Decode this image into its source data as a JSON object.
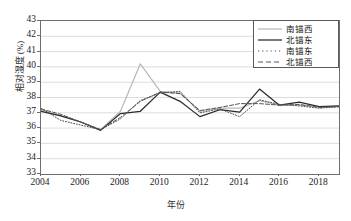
{
  "chart_data": {
    "type": "line",
    "title": "",
    "xlabel": "年份",
    "ylabel": "相对湿度 (%)",
    "xlim": [
      2004,
      2019
    ],
    "ylim": [
      33,
      43
    ],
    "grid": "horizontal",
    "legend_position": "top-right",
    "x": [
      2004,
      2005,
      2006,
      2007,
      2008,
      2009,
      2010,
      2011,
      2012,
      2013,
      2014,
      2015,
      2016,
      2017,
      2018,
      2019
    ],
    "y_ticks": [
      33,
      34,
      35,
      36,
      37,
      38,
      39,
      40,
      41,
      42,
      43
    ],
    "x_ticks": [
      2004,
      2006,
      2008,
      2010,
      2012,
      2014,
      2016,
      2018
    ],
    "series": [
      {
        "name": "南锚西",
        "style": "solid",
        "color": "#b9b9b9",
        "values": [
          37.2,
          36.8,
          36.4,
          35.9,
          37.1,
          40.2,
          38.4,
          38.3,
          37.1,
          37.3,
          37.3,
          37.8,
          37.5,
          37.5,
          37.4,
          37.4
        ]
      },
      {
        "name": "北锚东",
        "style": "solid",
        "color": "#2b2b2b",
        "values": [
          37.1,
          36.8,
          36.4,
          35.85,
          36.95,
          37.1,
          38.35,
          37.75,
          36.75,
          37.2,
          37.05,
          38.55,
          37.5,
          37.7,
          37.4,
          37.45
        ]
      },
      {
        "name": "南锚东",
        "style": "dotted",
        "color": "#4a4a4a",
        "values": [
          37.3,
          36.5,
          36.2,
          35.9,
          36.6,
          37.8,
          38.3,
          38.4,
          37.0,
          37.25,
          36.75,
          37.85,
          37.55,
          37.45,
          37.3,
          37.4
        ]
      },
      {
        "name": "北锚西",
        "style": "dashed",
        "color": "#555555",
        "values": [
          37.25,
          36.9,
          36.4,
          35.9,
          36.7,
          37.75,
          38.35,
          38.25,
          37.15,
          37.35,
          37.6,
          37.6,
          37.5,
          37.55,
          37.35,
          37.4
        ]
      }
    ]
  },
  "axis": {
    "y_title": "相对湿度 (%)",
    "x_title": "年份",
    "y_labels": [
      "43",
      "42",
      "41",
      "40",
      "39",
      "38",
      "37",
      "36",
      "35",
      "34",
      "33"
    ],
    "x_labels": [
      "2004",
      "2006",
      "2008",
      "2010",
      "2012",
      "2014",
      "2016",
      "2018"
    ]
  },
  "legend": {
    "items": [
      {
        "label": "南锚西",
        "style": "solid-light"
      },
      {
        "label": "北锚东",
        "style": "solid-dark"
      },
      {
        "label": "南锚东",
        "style": "dotted"
      },
      {
        "label": "北锚西",
        "style": "dashed"
      }
    ]
  }
}
